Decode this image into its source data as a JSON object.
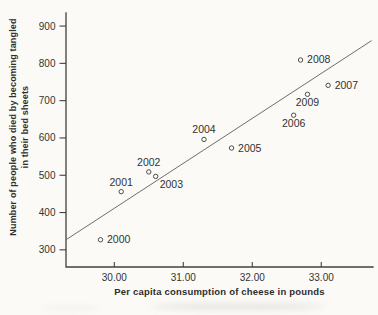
{
  "figure": {
    "background_color": "#fbfaf7",
    "ink_color": "#333333",
    "axis_color": "#414141",
    "trendline_color": "#6e6e6e",
    "marker": "open-circle"
  },
  "chart_data": {
    "type": "scatter",
    "title": "",
    "xlabel": "Per capita consumption of cheese in pounds",
    "ylabel_lines": [
      "Number of people who died by becoming tangled",
      "in their bed sheets"
    ],
    "xlim": [
      29.3,
      33.75
    ],
    "ylim": [
      254,
      935
    ],
    "grid": false,
    "legend": null,
    "x_ticks": [
      {
        "value": 30,
        "label": "30.00"
      },
      {
        "value": 31,
        "label": "31.00"
      },
      {
        "value": 32,
        "label": "32.00"
      },
      {
        "value": 33,
        "label": "33.00"
      }
    ],
    "y_ticks": [
      {
        "value": 300,
        "label": "300"
      },
      {
        "value": 400,
        "label": "400"
      },
      {
        "value": 500,
        "label": "500"
      },
      {
        "value": 600,
        "label": "600"
      },
      {
        "value": 700,
        "label": "700"
      },
      {
        "value": 800,
        "label": "800"
      },
      {
        "value": 900,
        "label": "900"
      }
    ],
    "points": [
      {
        "label": "2000",
        "x": 29.8,
        "y": 327,
        "label_pos": "right"
      },
      {
        "label": "2001",
        "x": 30.1,
        "y": 456,
        "label_pos": "above"
      },
      {
        "label": "2002",
        "x": 30.5,
        "y": 509,
        "label_pos": "above"
      },
      {
        "label": "2003",
        "x": 30.6,
        "y": 497,
        "label_pos": "below-right"
      },
      {
        "label": "2004",
        "x": 31.3,
        "y": 596,
        "label_pos": "above"
      },
      {
        "label": "2005",
        "x": 31.7,
        "y": 573,
        "label_pos": "right"
      },
      {
        "label": "2006",
        "x": 32.6,
        "y": 661,
        "label_pos": "below"
      },
      {
        "label": "2007",
        "x": 33.1,
        "y": 741,
        "label_pos": "right"
      },
      {
        "label": "2008",
        "x": 32.7,
        "y": 809,
        "label_pos": "right"
      },
      {
        "label": "2009",
        "x": 32.8,
        "y": 717,
        "label_pos": "below"
      }
    ],
    "trendline": {
      "x1": 29.3,
      "y1": 327,
      "x2": 33.73,
      "y2": 861
    }
  }
}
